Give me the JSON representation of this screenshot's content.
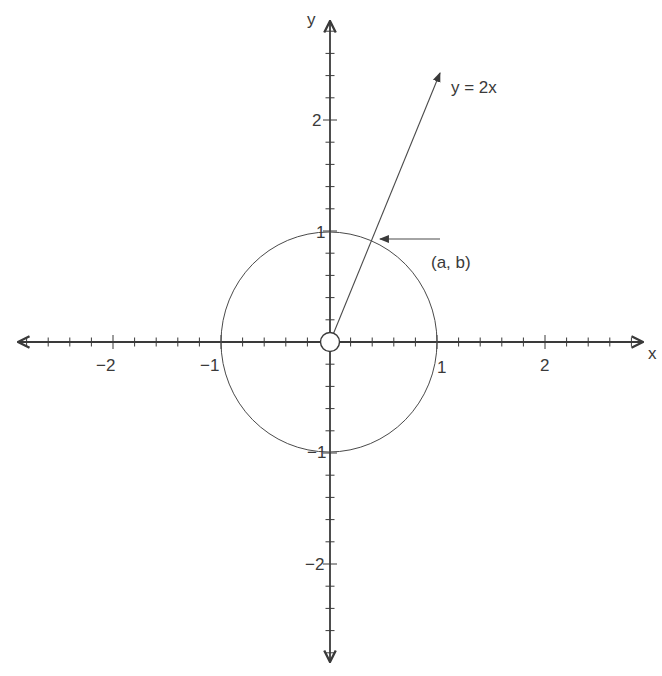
{
  "figure": {
    "x_axis_label": "x",
    "y_axis_label": "y",
    "line_label": "y = 2x",
    "point_label": "(a, b)",
    "x_tick_labels": [
      {
        "value": -2,
        "text": "−2"
      },
      {
        "value": -1,
        "text": "−1"
      },
      {
        "value": 1,
        "text": "1"
      },
      {
        "value": 2,
        "text": "2"
      }
    ],
    "y_tick_labels": [
      {
        "value": 2,
        "text": "2"
      },
      {
        "value": 1,
        "text": "1"
      },
      {
        "value": -1,
        "text": "−1"
      },
      {
        "value": -2,
        "text": "−2"
      }
    ],
    "minor_tick_step": 0.2,
    "axis_range": [
      -2.8,
      2.8
    ],
    "elements": {
      "unit_circle": {
        "center": [
          0,
          0
        ],
        "radius": 1
      },
      "line": {
        "equation": "y = 2x",
        "from": [
          0,
          0
        ],
        "to": [
          1.03,
          2.5
        ]
      },
      "open_point_at_origin": [
        0,
        0
      ],
      "intersection_point": [
        "a",
        "b"
      ]
    },
    "colors": {
      "ink": "#3a3a3a",
      "background": "#ffffff"
    }
  }
}
